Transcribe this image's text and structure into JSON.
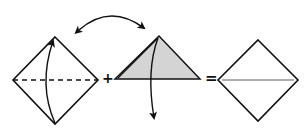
{
  "diagram": {
    "steps": [
      {
        "id": "square-base",
        "shape": "diamond",
        "fold_line": "dashed-horizontal",
        "arrow": "valley-fold-up"
      },
      {
        "id": "folded-triangle",
        "shape": "triangle",
        "fill": "#d4d4d4",
        "arrow": "unfold-down"
      },
      {
        "id": "result-square",
        "shape": "diamond",
        "crease": "horizontal"
      }
    ],
    "operators": {
      "plus": "+",
      "equals": "="
    },
    "top_arrow": "double-headed-swap-arrow",
    "colors": {
      "line": "#111111",
      "fill": "#d4d4d4",
      "background": "#ffffff"
    }
  }
}
